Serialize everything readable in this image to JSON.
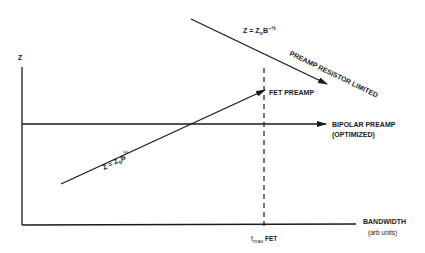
{
  "diagram": {
    "y_axis_label": "Z",
    "x_axis_label": "BANDWIDTH",
    "x_axis_units": "(arb units)",
    "fmax_label": {
      "f": "f",
      "sub": "max",
      "rest": " FET"
    },
    "resistor_line": {
      "equation": {
        "z": "Z = Z",
        "sub": "o",
        "b": "B",
        "sup": "−½"
      },
      "label": "PREAMP RESISTOR LIMITED"
    },
    "fet_line": {
      "equation": {
        "z": "Z = Z",
        "sub": "o",
        "b": "B",
        "sup": "½"
      },
      "label": "FET PREAMP"
    },
    "bipolar_line": {
      "label_line1": "BIPOLAR PREAMP",
      "label_line2": "(OPTIMIZED)"
    },
    "colors": {
      "ink": "#1a1a1a",
      "background": "#ffffff"
    }
  }
}
